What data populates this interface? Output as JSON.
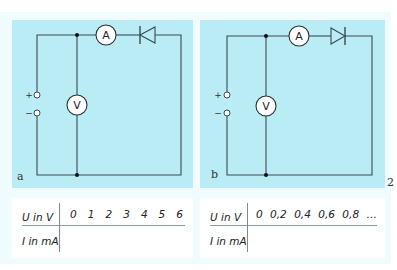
{
  "figure": {
    "page_marker": "2",
    "background_color": "#effbfd",
    "panel_color": "#b9ecf4"
  },
  "circuits": [
    {
      "label": "a",
      "supply": {
        "plus": "+",
        "minus": "−"
      },
      "ammeter": "A",
      "voltmeter": "V",
      "diode_direction": "reverse (points left)"
    },
    {
      "label": "b",
      "supply": {
        "plus": "+",
        "minus": "−"
      },
      "ammeter": "A",
      "voltmeter": "V",
      "diode_direction": "forward (points right)"
    }
  ],
  "tables": [
    {
      "row1_header": "U in V",
      "row1_values": [
        "0",
        "1",
        "2",
        "3",
        "4",
        "5",
        "6"
      ],
      "row2_header": "I in mA",
      "row2_values": []
    },
    {
      "row1_header": "U in V",
      "row1_values": [
        "0",
        "0,2",
        "0,4",
        "0,6",
        "0,8",
        "…"
      ],
      "row2_header": "I in mA",
      "row2_values": []
    }
  ]
}
